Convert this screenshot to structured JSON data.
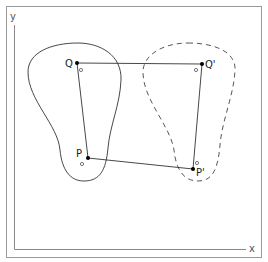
{
  "figure": {
    "axes": {
      "x_label": "x",
      "y_label": "y"
    },
    "points": {
      "Q": {
        "label": "Q",
        "x": 77,
        "y": 63
      },
      "Q_prime": {
        "label": "Q'",
        "x": 202,
        "y": 64
      },
      "P": {
        "label": "P",
        "x": 88,
        "y": 158
      },
      "P_prime": {
        "label": "P'",
        "x": 193,
        "y": 169
      }
    },
    "shapes": {
      "original": {
        "style": "solid",
        "description": "original body"
      },
      "displaced": {
        "style": "dashed",
        "description": "displaced body"
      }
    },
    "colors": {
      "frame": "#9a9a9a",
      "axes": "#8a8a8a",
      "outline": "#333333",
      "point": "#000000"
    }
  }
}
